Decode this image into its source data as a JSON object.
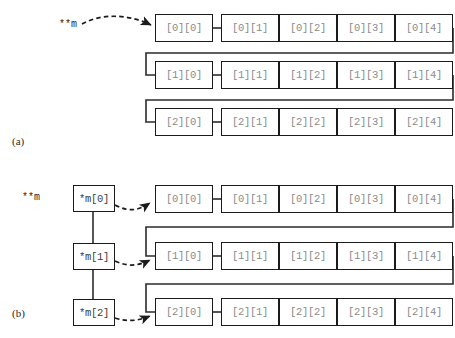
{
  "figure": {
    "title_caption": "",
    "panels": [
      {
        "id": "a",
        "label": "(a)",
        "pointer_label": "**m",
        "rows": [
          {
            "cells": [
              "[0][0]",
              "[0][1]",
              "[0][2]",
              "[0][3]",
              "[0][4]"
            ]
          },
          {
            "cells": [
              "[1][0]",
              "[1][1]",
              "[1][2]",
              "[1][3]",
              "[1][4]"
            ]
          },
          {
            "cells": [
              "[2][0]",
              "[2][1]",
              "[2][2]",
              "[2][3]",
              "[2][4]"
            ]
          }
        ]
      },
      {
        "id": "b",
        "label": "(b)",
        "pointer_label": "**m",
        "pointer_cells": [
          "*m[0]",
          "*m[1]",
          "*m[2]"
        ],
        "rows": [
          {
            "cells": [
              "[0][0]",
              "[0][1]",
              "[0][2]",
              "[0][3]",
              "[0][4]"
            ]
          },
          {
            "cells": [
              "[1][0]",
              "[1][1]",
              "[1][2]",
              "[1][3]",
              "[1][4]"
            ]
          },
          {
            "cells": [
              "[2][0]",
              "[2][1]",
              "[2][2]",
              "[2][3]",
              "[2][4]"
            ]
          }
        ]
      }
    ]
  },
  "colors": {
    "box_border": "#1b1b1b",
    "cell_text": "#8a8a8a",
    "pointer_text": "#3c3c3c",
    "connector": "#2b2b2b",
    "background": "#ffffff"
  }
}
